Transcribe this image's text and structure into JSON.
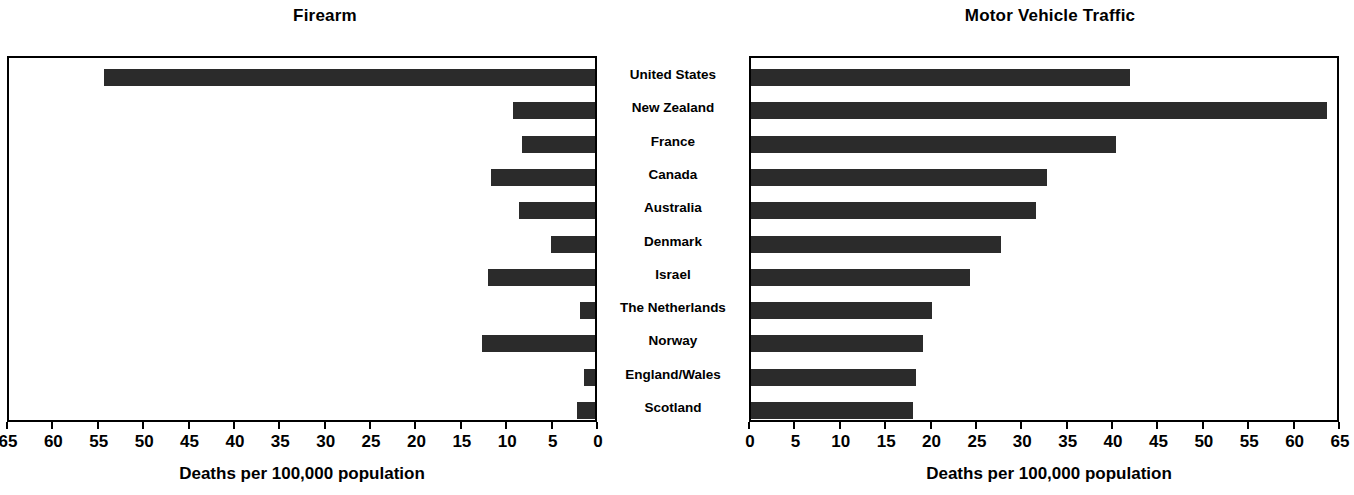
{
  "chart_data": [
    {
      "type": "bar",
      "orientation": "horizontal",
      "title": "Firearm",
      "xlabel": "Deaths per 100,000 population",
      "ylabel": "",
      "xlim": [
        65,
        0
      ],
      "reversed_axis": true,
      "xticks": [
        65,
        60,
        55,
        50,
        45,
        40,
        35,
        30,
        25,
        20,
        15,
        10,
        5,
        0
      ],
      "grid": false,
      "legend": "none",
      "bar_color": "#2b2b2b",
      "categories": [
        "United States",
        "New Zealand",
        "France",
        "Canada",
        "Australia",
        "Denmark",
        "Israel",
        "The Netherlands",
        "Norway",
        "England/Wales",
        "Scotland"
      ],
      "values": [
        54.1,
        9.0,
        8.0,
        11.5,
        8.4,
        4.9,
        11.8,
        1.7,
        12.4,
        1.2,
        2.0
      ]
    },
    {
      "type": "bar",
      "orientation": "horizontal",
      "title": "Motor Vehicle Traffic",
      "xlabel": "Deaths per 100,000 population",
      "ylabel": "",
      "xlim": [
        0,
        65
      ],
      "reversed_axis": false,
      "xticks": [
        0,
        5,
        10,
        15,
        20,
        25,
        30,
        35,
        40,
        45,
        50,
        55,
        60,
        65
      ],
      "grid": false,
      "legend": "none",
      "bar_color": "#2b2b2b",
      "categories": [
        "United States",
        "New Zealand",
        "France",
        "Canada",
        "Australia",
        "Denmark",
        "Israel",
        "The Netherlands",
        "Norway",
        "England/Wales",
        "Scotland"
      ],
      "values": [
        41.7,
        63.5,
        40.2,
        32.6,
        31.4,
        27.5,
        24.1,
        19.9,
        19.0,
        18.2,
        17.9
      ]
    }
  ],
  "left_panel": {
    "title": "Firearm",
    "axis_title": "Deaths per 100,000 population",
    "tick_labels": [
      "65",
      "60",
      "55",
      "50",
      "45",
      "40",
      "35",
      "30",
      "25",
      "20",
      "15",
      "10",
      "5",
      "0"
    ]
  },
  "right_panel": {
    "title": "Motor Vehicle Traffic",
    "axis_title": "Deaths per 100,000 population",
    "tick_labels": [
      "0",
      "5",
      "10",
      "15",
      "20",
      "25",
      "30",
      "35",
      "40",
      "45",
      "50",
      "55",
      "60",
      "65"
    ]
  },
  "categories": [
    "United States",
    "New Zealand",
    "France",
    "Canada",
    "Australia",
    "Denmark",
    "Israel",
    "The Netherlands",
    "Norway",
    "England/Wales",
    "Scotland"
  ]
}
